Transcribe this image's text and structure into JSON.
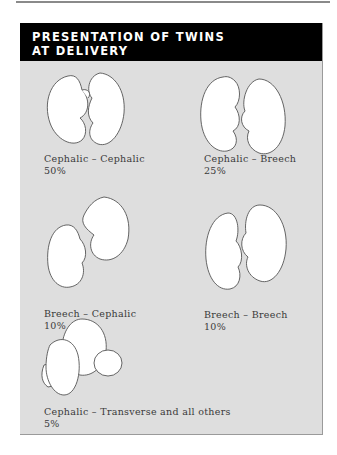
{
  "title": {
    "line1": "PRESENTATION OF TWINS",
    "line2": "AT DELIVERY"
  },
  "presentations": [
    {
      "label": "Cephalic –  Cephalic",
      "percent": "50%"
    },
    {
      "label": "Cephalic –  Breech",
      "percent": "25%"
    },
    {
      "label": "Breech –  Cephalic",
      "percent": "10%"
    },
    {
      "label": "Breech –  Breech",
      "percent": "10%"
    },
    {
      "label": "Cephalic –  Transverse and all others",
      "percent": "5%"
    }
  ],
  "colors": {
    "header_bg": "#000000",
    "header_text": "#ffffff",
    "panel_bg": "#dedede",
    "caption_text": "#3a3a3a"
  }
}
